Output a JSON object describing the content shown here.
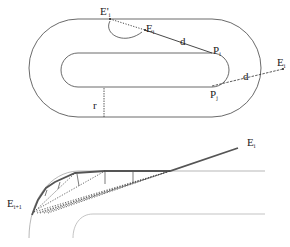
{
  "top_figure": {
    "labels": {
      "E_prime": "E'",
      "E_prime_sub": "i",
      "E_i_upper": "E",
      "E_i_upper_sub": "i",
      "d_upper": "d",
      "P_i": "P",
      "P_i_sub": "i",
      "E_i_right": "E",
      "E_i_right_sub": "i",
      "d_lower": "d",
      "P_j": "P",
      "P_j_sub": "j",
      "r": "r"
    }
  },
  "bottom_figure": {
    "labels": {
      "E_i": "E",
      "E_i_sub": "i",
      "E_next": "E",
      "E_next_sub": "i+1"
    }
  },
  "colors": {
    "stroke": "#333333",
    "thick": "#555555",
    "dotted": "#444444",
    "light": "#888888"
  }
}
